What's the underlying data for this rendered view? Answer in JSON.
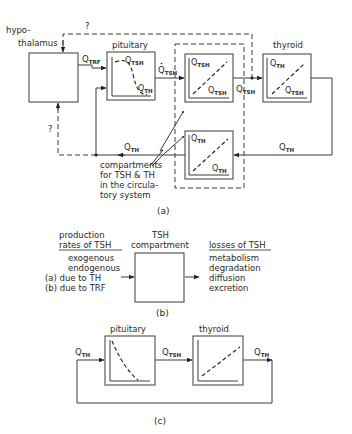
{
  "panel_a": {
    "caption": "(a)",
    "hypothalamus": {
      "label_line1": "hypo-",
      "label_line2": "thalamus"
    },
    "pituitary": {
      "label": "pituitary",
      "y_axis": "Q",
      "y_sub": "TSH",
      "x_axis": "Q",
      "x_sub": "TH"
    },
    "thyroid": {
      "label": "thyroid",
      "y_axis": "Q",
      "y_sub": "TH",
      "x_axis": "Q",
      "x_sub": "TSH"
    },
    "tsh_compartment": {
      "y_axis": "Q",
      "y_sub": "TSH",
      "x_axis": "Q",
      "x_sub": "TSH"
    },
    "th_compartment": {
      "y_axis": "Q",
      "y_sub": "TH",
      "x_axis": "Q",
      "x_sub": "TH"
    },
    "signals": {
      "q_trf": {
        "main": "Q",
        "sub": "TRF"
      },
      "qdot_tsh": {
        "main": "Q",
        "sub": "TSH"
      },
      "q_tsh": {
        "main": "Q",
        "sub": "TSH"
      },
      "qdot_th": {
        "main": "Q",
        "sub": "TH"
      },
      "q_th": {
        "main": "Q",
        "sub": "TH"
      }
    },
    "unknown_top": "?",
    "unknown_left": "?",
    "annotation": [
      "compartments",
      "for TSH & TH",
      "in the circula-",
      "tory system"
    ]
  },
  "panel_b": {
    "caption": "(b)",
    "compartment_title": [
      "TSH",
      "compartment"
    ],
    "inputs_title": [
      "production",
      "rates of TSH"
    ],
    "inputs": [
      "exogenous",
      "endogenous",
      "(a) due to TH",
      "(b) due to TRF"
    ],
    "outputs_title": "losses of TSH",
    "outputs": [
      "metabolism",
      "degradation",
      "diffusion",
      "excretion"
    ]
  },
  "panel_c": {
    "caption": "(c)",
    "pituitary_label": "pituitary",
    "thyroid_label": "thyroid",
    "input": {
      "main": "Q",
      "sub": "TH"
    },
    "middle": {
      "main": "Q",
      "sub": "TSH"
    },
    "output": {
      "main": "Q",
      "sub": "TH"
    }
  }
}
